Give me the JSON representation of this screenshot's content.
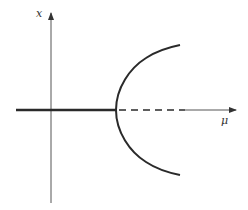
{
  "diagram": {
    "type": "pitchfork-bifurcation",
    "axes": {
      "vertical_label": "x",
      "horizontal_label": "μ"
    },
    "branches": {
      "stable_trivial": "solid line for μ < 0",
      "unstable_trivial": "dashed line for μ > 0",
      "stable_nontrivial": "parabola x = ±√μ"
    },
    "colors": {
      "ink": "#2a2a2a",
      "axis": "#555555",
      "background": "#ffffff"
    }
  }
}
